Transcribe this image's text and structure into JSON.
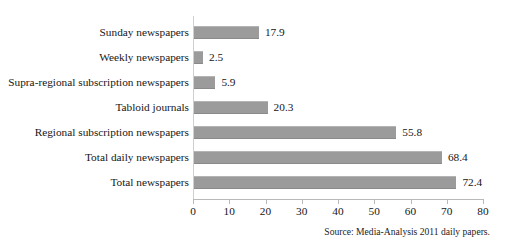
{
  "title_fragment": "",
  "source_note": "Source: Media-Analysis 2011 daily papers.",
  "colors": {
    "bar": "#9b9b9b",
    "axis": "#b9b9b9",
    "text": "#151515",
    "background": "#ffffff"
  },
  "chart_data": {
    "type": "bar",
    "orientation": "horizontal",
    "title": "",
    "subtitle": "",
    "xlabel": "",
    "ylabel": "",
    "xlim": [
      0,
      80
    ],
    "xticks": [
      0,
      10,
      20,
      30,
      40,
      50,
      60,
      70,
      80
    ],
    "grid": false,
    "legend": null,
    "categories": [
      "Sunday newspapers",
      "Weekly newspapers",
      "Supra-regional subscription newspapers",
      "Tabloid journals",
      "Regional subscription newspapers",
      "Total daily newspapers",
      "Total newspapers"
    ],
    "values": [
      17.9,
      2.5,
      5.9,
      20.3,
      55.8,
      68.4,
      72.4
    ],
    "value_labels": [
      "17.9",
      "2.5",
      "5.9",
      "20.3",
      "55.8",
      "68.4",
      "72.4"
    ],
    "annotations": [
      "Source: Media-Analysis 2011 daily papers."
    ]
  }
}
